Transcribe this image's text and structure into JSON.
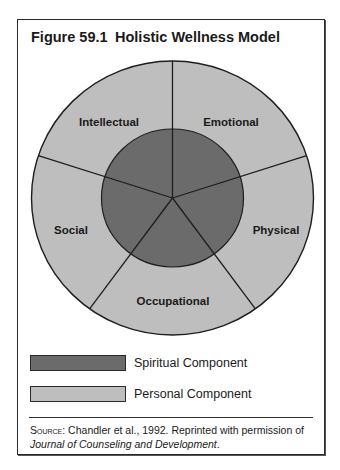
{
  "figure": {
    "number": "Figure 59.1",
    "title": "Holistic Wellness Model"
  },
  "diagram": {
    "type": "concentric-pie",
    "center": {
      "x": 172.5,
      "y": 198
    },
    "outer_radius": {
      "rx": 141,
      "ry": 137
    },
    "inner_radius": {
      "rx": 71,
      "ry": 69
    },
    "colors": {
      "inner": "#6b6b6b",
      "outer": "#bebebe",
      "stroke": "#1e1e1e"
    },
    "inner_component": "Spiritual",
    "segments": [
      {
        "label": "Emotional",
        "label_x": 231,
        "label_y": 126
      },
      {
        "label": "Physical",
        "label_x": 276,
        "label_y": 234
      },
      {
        "label": "Occupational",
        "label_x": 173,
        "label_y": 305
      },
      {
        "label": "Social",
        "label_x": 71,
        "label_y": 234
      },
      {
        "label": "Intellectual",
        "label_x": 109,
        "label_y": 126
      }
    ]
  },
  "legend": {
    "items": [
      {
        "label": "Spiritual Component",
        "color": "#6b6b6b"
      },
      {
        "label": "Personal Component",
        "color": "#bebebe"
      }
    ]
  },
  "source": {
    "label": "Source:",
    "text": " Chandler et al., 1992. Reprinted with permission of",
    "journal": "Journal of Counseling and Development",
    "end": "."
  }
}
